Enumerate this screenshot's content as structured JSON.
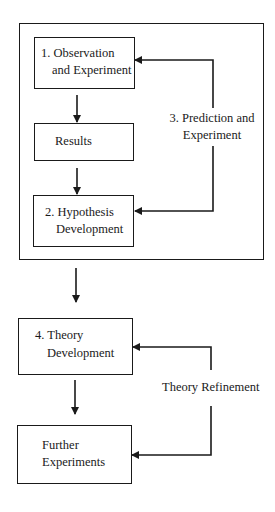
{
  "diagram": {
    "type": "flowchart",
    "nodes": {
      "observation": {
        "line1": "1. Observation",
        "line2": "and Experiment"
      },
      "results": {
        "line1": "Results"
      },
      "hypothesis": {
        "line1": "2. Hypothesis",
        "line2": "Development"
      },
      "theory": {
        "line1": "4. Theory",
        "line2": "Development"
      },
      "further": {
        "line1": "Further",
        "line2": "Experiments"
      }
    },
    "edge_labels": {
      "prediction": {
        "line1": "3. Prediction and",
        "line2": "Experiment"
      },
      "refinement": {
        "line1": "Theory Refinement"
      }
    },
    "edges": [
      {
        "from": "observation",
        "to": "results"
      },
      {
        "from": "results",
        "to": "hypothesis"
      },
      {
        "from": "hypothesis",
        "to": "observation",
        "label": "3. Prediction and Experiment"
      },
      {
        "from": "hypothesis",
        "to": "prediction-loop-group"
      },
      {
        "from": "prediction-loop-group",
        "to": "theory"
      },
      {
        "from": "theory",
        "to": "further"
      },
      {
        "from": "further",
        "to": "theory",
        "label": "Theory Refinement"
      }
    ],
    "colors": {
      "line": "#1a1a1a",
      "background": "#ffffff"
    }
  }
}
